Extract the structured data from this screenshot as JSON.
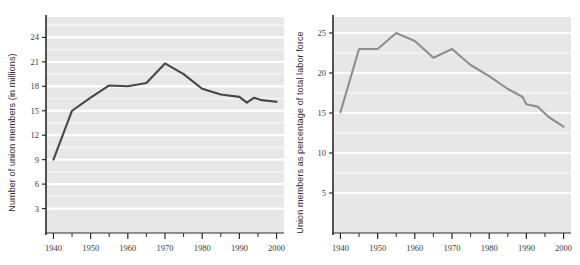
{
  "figure": {
    "background": "#ffffff",
    "plot_background": "#e7e7e7",
    "gridline_color": "#ffffff",
    "axis_color": "#2a2a2a"
  },
  "chart_data": [
    {
      "id": "union-members-millions",
      "type": "line",
      "title": "",
      "xlabel": "",
      "ylabel": "Number of union members (in millions)",
      "line_color": "#474747",
      "xlim": [
        1938,
        2002
      ],
      "ylim": [
        0,
        26.5
      ],
      "grid": true,
      "legend": "none",
      "xticks": [
        1940,
        1950,
        1960,
        1970,
        1980,
        1990,
        2000
      ],
      "xticklabels": [
        "1940",
        "1950",
        "1960",
        "1970",
        "1980",
        "1990",
        "2000"
      ],
      "xminor_ticks": [
        1945,
        1955,
        1965,
        1975,
        1985,
        1995
      ],
      "yticks": [
        3,
        6,
        9,
        12,
        15,
        18,
        21,
        24
      ],
      "yticklabels": [
        "3",
        "6",
        "9",
        "12",
        "15",
        "18",
        "21",
        "24"
      ],
      "x": [
        1940,
        1945,
        1950,
        1955,
        1960,
        1965,
        1970,
        1975,
        1980,
        1985,
        1990,
        1992,
        1994,
        1996,
        2000
      ],
      "values": [
        9.0,
        15.0,
        16.6,
        18.1,
        18.0,
        18.4,
        20.8,
        19.5,
        17.7,
        17.0,
        16.7,
        16.0,
        16.6,
        16.3,
        16.1
      ]
    },
    {
      "id": "union-members-percent",
      "type": "line",
      "title": "",
      "xlabel": "",
      "ylabel": "Union members as percentage of total labor force",
      "line_color": "#8e8e8e",
      "xlim": [
        1938,
        2002
      ],
      "ylim": [
        0,
        27
      ],
      "grid": true,
      "legend": "none",
      "xticks": [
        1940,
        1950,
        1960,
        1970,
        1980,
        1990,
        2000
      ],
      "xticklabels": [
        "1940",
        "1950",
        "1960",
        "1970",
        "1980",
        "1990",
        "2000"
      ],
      "xminor_ticks": [
        1945,
        1955,
        1965,
        1975,
        1985,
        1995
      ],
      "yticks": [
        5,
        10,
        15,
        20,
        25
      ],
      "yticklabels": [
        "5",
        "10",
        "15",
        "20",
        "25"
      ],
      "x": [
        1940,
        1945,
        1950,
        1955,
        1960,
        1965,
        1970,
        1975,
        1980,
        1985,
        1989,
        1990,
        1993,
        1996,
        2000
      ],
      "values": [
        15.1,
        23.0,
        23.0,
        25.0,
        24.0,
        21.9,
        23.0,
        21.0,
        19.6,
        18.0,
        17.0,
        16.1,
        15.8,
        14.5,
        13.3
      ]
    }
  ]
}
